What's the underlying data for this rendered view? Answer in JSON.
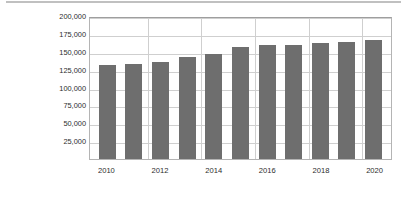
{
  "chart_data": {
    "type": "bar",
    "title": "",
    "xlabel": "",
    "ylabel": "시장 규모(단위: 백만 달러)",
    "categories": [
      "2010",
      "2011",
      "2012",
      "2013",
      "2014",
      "2015",
      "2016",
      "2017",
      "2018",
      "2019",
      "2020"
    ],
    "values": [
      131000,
      133000,
      136000,
      142000,
      147000,
      157000,
      159000,
      160000,
      162000,
      164000,
      166000
    ],
    "x_tick_labels": [
      "2010",
      "2012",
      "2014",
      "2016",
      "2018",
      "2020"
    ],
    "y_tick_labels": [
      "200,000",
      "175,000",
      "150,000",
      "125,000",
      "100,000",
      "75,000",
      "50,000",
      "25,000"
    ],
    "y_tick_values": [
      200000,
      175000,
      150000,
      125000,
      100000,
      75000,
      50000,
      25000
    ],
    "ylim": [
      0,
      200000
    ],
    "grid": "horizontal-and-vertical",
    "legend": "none",
    "bar_color": "#6e6e6e",
    "grid_color": "#cfcfcf",
    "axis_color": "#b4b4b4",
    "background_color": "#ffffff"
  }
}
